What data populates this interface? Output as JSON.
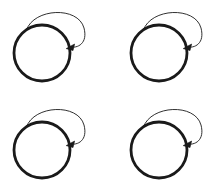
{
  "canvas": {
    "width": 211,
    "height": 183,
    "background_color": "#ffffff"
  },
  "diagram": {
    "title": "",
    "kind": "state-with-self-loop",
    "repeat_count": 4,
    "grid": {
      "rows": 2,
      "columns": 2
    },
    "stroke_color": "#1a1a1a",
    "node_fill_color": "#ffffff",
    "node_stroke_width": 2.8,
    "loop_stroke_width": 0.9,
    "arrowhead_color": "#1a1a1a"
  },
  "figures": [
    {
      "id": "figure-top-left",
      "label": "",
      "row": 0,
      "column": 0,
      "node": {
        "cx": 42,
        "cy": 53,
        "r": 28
      },
      "self_loop": {
        "cx": 62,
        "cy": 30,
        "r": 22
      },
      "arrow_tip": {
        "x": 68,
        "y": 47
      }
    },
    {
      "id": "figure-top-right",
      "label": "",
      "row": 0,
      "column": 1,
      "node": {
        "cx": 42,
        "cy": 53,
        "r": 28
      },
      "self_loop": {
        "cx": 62,
        "cy": 30,
        "r": 22
      },
      "arrow_tip": {
        "x": 68,
        "y": 47
      }
    },
    {
      "id": "figure-bottom-left",
      "label": "",
      "row": 1,
      "column": 0,
      "node": {
        "cx": 42,
        "cy": 53,
        "r": 28
      },
      "self_loop": {
        "cx": 62,
        "cy": 30,
        "r": 22
      },
      "arrow_tip": {
        "x": 68,
        "y": 47
      }
    },
    {
      "id": "figure-bottom-right",
      "label": "",
      "row": 1,
      "column": 1,
      "node": {
        "cx": 42,
        "cy": 53,
        "r": 28
      },
      "self_loop": {
        "cx": 62,
        "cy": 30,
        "r": 22
      },
      "arrow_tip": {
        "x": 68,
        "y": 47
      }
    }
  ]
}
